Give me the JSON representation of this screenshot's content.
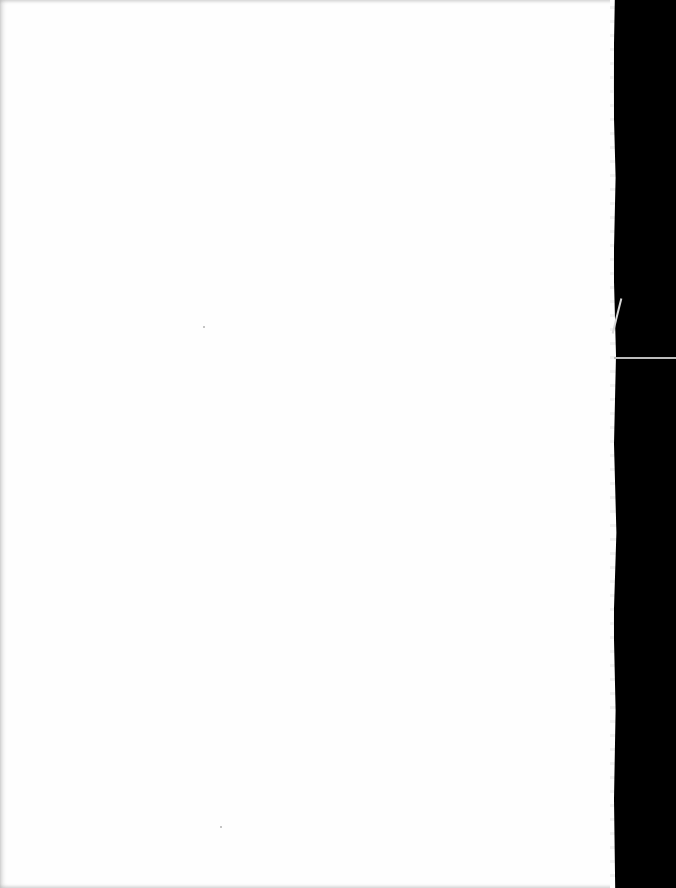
{
  "document": {
    "type": "scanned-page",
    "content": "",
    "blank": true,
    "colors": {
      "page": "#fefefe",
      "background": "#000000",
      "edge_line": "#bcbcbc"
    }
  }
}
